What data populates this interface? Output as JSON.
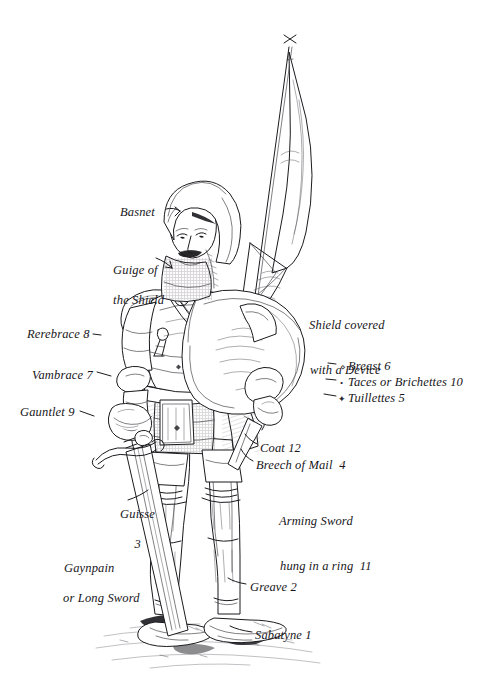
{
  "figure": {
    "style": "pen-and-ink line engraving",
    "background_color": "#ffffff",
    "ink_color": "#1b1a1e"
  },
  "labels": [
    {
      "id": "basnet",
      "text": "Basnet",
      "number": "",
      "x": 120,
      "y": 205,
      "marker": ""
    },
    {
      "id": "guige",
      "line1": "Guige of",
      "line2": "the Shield",
      "number": "",
      "x": 100,
      "y": 248,
      "marker": ""
    },
    {
      "id": "rerebrace",
      "text": "Rerebrace 8",
      "number": "8",
      "x": 27,
      "y": 327,
      "marker": "·"
    },
    {
      "id": "vambrace",
      "text": "Vambrace 7",
      "number": "7",
      "x": 32,
      "y": 368,
      "marker": ""
    },
    {
      "id": "gauntlet",
      "text": "Gauntlet 9",
      "number": "9",
      "x": 20,
      "y": 405,
      "marker": ""
    },
    {
      "id": "shield-device",
      "line1": "Shield covered",
      "line2": "with a Device",
      "number": "",
      "x": 296,
      "y": 303,
      "marker": ""
    },
    {
      "id": "breast",
      "text": "Breast 6",
      "number": "6",
      "x": 345,
      "y": 360,
      "marker": "⋄"
    },
    {
      "id": "taces",
      "text": "Taces or Brichettes 10",
      "number": "10",
      "x": 345,
      "y": 376,
      "marker": "•"
    },
    {
      "id": "tuillettes",
      "text": "Tuillettes 5",
      "number": "5",
      "x": 345,
      "y": 392,
      "marker": "✦"
    },
    {
      "id": "coat",
      "text": "Coat 12",
      "number": "12",
      "x": 260,
      "y": 444,
      "marker": ""
    },
    {
      "id": "breech",
      "text": "Breech of Mail  4",
      "number": "4",
      "x": 256,
      "y": 461,
      "marker": ""
    },
    {
      "id": "guisse",
      "line1": "Guisse",
      "line2": "3",
      "number": "3",
      "x": 107,
      "y": 492,
      "marker": ""
    },
    {
      "id": "arming-sword",
      "line1": "Arming Sword",
      "line2": "hung in a ring  11",
      "number": "11",
      "x": 266,
      "y": 499,
      "marker": ""
    },
    {
      "id": "gaynpain",
      "line1": "Gaynpain",
      "line2": "or Long Sword",
      "number": "",
      "x": 50,
      "y": 531,
      "marker": ""
    },
    {
      "id": "greave",
      "text": "Greave 2",
      "number": "2",
      "x": 250,
      "y": 582,
      "marker": ""
    },
    {
      "id": "sabatyne",
      "text": "Sabatyne 1",
      "number": "1",
      "x": 255,
      "y": 630,
      "marker": ""
    }
  ],
  "parts_list": [
    {
      "number": "1",
      "name": "Sabatyne"
    },
    {
      "number": "2",
      "name": "Greave"
    },
    {
      "number": "3",
      "name": "Guisse"
    },
    {
      "number": "4",
      "name": "Breech of Mail"
    },
    {
      "number": "5",
      "name": "Tuillettes"
    },
    {
      "number": "6",
      "name": "Breast"
    },
    {
      "number": "7",
      "name": "Vambrace"
    },
    {
      "number": "8",
      "name": "Rerebrace"
    },
    {
      "number": "9",
      "name": "Gauntlet"
    },
    {
      "number": "10",
      "name": "Taces or Brichettes"
    },
    {
      "number": "11",
      "name": "Arming Sword hung in a ring"
    },
    {
      "number": "12",
      "name": "Coat"
    }
  ],
  "unnumbered_parts": [
    "Basnet",
    "Guige of the Shield",
    "Shield covered with a Device",
    "Gaynpain or Long Sword"
  ]
}
